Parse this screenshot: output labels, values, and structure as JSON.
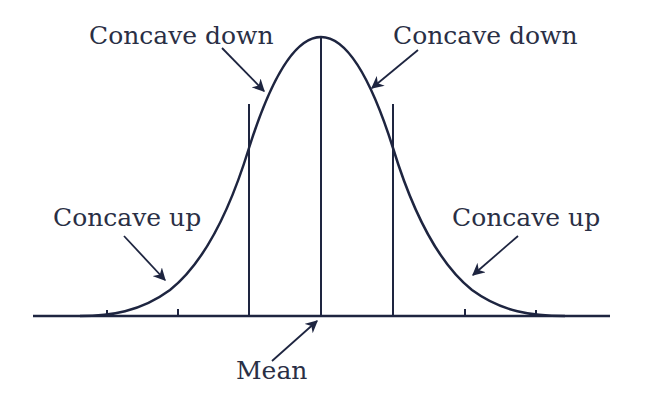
{
  "diagram": {
    "colors": {
      "ink": "#1e2540",
      "text": "#2a2f45",
      "background": "#ffffff"
    },
    "labels": {
      "top_left": "Concave down",
      "top_right": "Concave down",
      "mid_left": "Concave up",
      "mid_right": "Concave up",
      "bottom": "Mean"
    },
    "axis": {
      "x_start": 33,
      "x_end": 610,
      "baseline_y": 316
    },
    "ticks_x": [
      107,
      178,
      465,
      536
    ],
    "vertical_lines": [
      {
        "name": "inflection-left",
        "x": 249,
        "top_y": 104
      },
      {
        "name": "mean",
        "x": 321,
        "top_y": 37
      },
      {
        "name": "inflection-right",
        "x": 393,
        "top_y": 104
      }
    ]
  }
}
